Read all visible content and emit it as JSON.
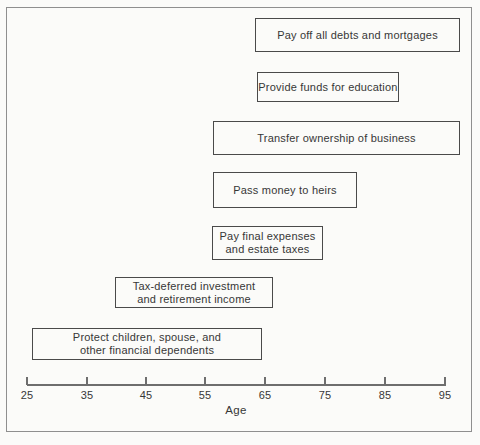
{
  "colors": {
    "background": "#fbfbf9",
    "frame_border": "#8f8f8f",
    "box_border": "#4a4a4a",
    "axis": "#6e6e6e",
    "text": "#373737"
  },
  "chart_data": {
    "type": "bar",
    "subtype": "horizontal-timeline",
    "title": "",
    "xlabel": "Age",
    "ylabel": "",
    "xlim": [
      25,
      95
    ],
    "x_ticks": [
      "25",
      "35",
      "45",
      "55",
      "65",
      "75",
      "85",
      "95"
    ],
    "grid": false,
    "legend": false,
    "items": [
      {
        "label": "Pay off all debts and mortgages",
        "lines": [
          "Pay off all debts and mortgages"
        ],
        "age_start": 63,
        "age_end": 97
      },
      {
        "label": "Provide funds for education",
        "lines": [
          "Provide funds for education"
        ],
        "age_start": 63,
        "age_end": 87
      },
      {
        "label": "Transfer ownership of business",
        "lines": [
          "Transfer ownership of business"
        ],
        "age_start": 56,
        "age_end": 97
      },
      {
        "label": "Pass money to heirs",
        "lines": [
          "Pass money to heirs"
        ],
        "age_start": 56,
        "age_end": 80
      },
      {
        "label": "Pay final expenses and estate taxes",
        "lines": [
          "Pay final expenses",
          "and estate taxes"
        ],
        "age_start": 56,
        "age_end": 74
      },
      {
        "label": "Tax-deferred investment and retirement income",
        "lines": [
          "Tax-deferred investment",
          "and retirement income"
        ],
        "age_start": 40,
        "age_end": 66
      },
      {
        "label": "Protect children, spouse, and other financial dependents",
        "lines": [
          "Protect children, spouse, and",
          "other financial dependents"
        ],
        "age_start": 26,
        "age_end": 64
      }
    ]
  }
}
